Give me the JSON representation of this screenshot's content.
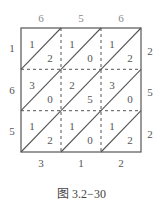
{
  "top_digits": [
    "6",
    "5",
    "6"
  ],
  "left_digits": [
    "1",
    "6",
    "5"
  ],
  "right_digits": [
    "2",
    "5",
    "2"
  ],
  "bottom_digits": [
    "3",
    "1",
    "2"
  ],
  "cells": [
    [
      {
        "tl": "1",
        "br": "2"
      },
      {
        "tl": "1",
        "br": "0"
      },
      {
        "tl": "1",
        "br": "2"
      }
    ],
    [
      {
        "tl": "3",
        "br": "0"
      },
      {
        "tl": "2",
        "br": "5"
      },
      {
        "tl": "3",
        "br": "0"
      }
    ],
    [
      {
        "tl": "1",
        "br": "2"
      },
      {
        "tl": "1",
        "br": "0"
      },
      {
        "tl": "1",
        "br": "2"
      }
    ]
  ],
  "caption": "图 3.2−30"
}
